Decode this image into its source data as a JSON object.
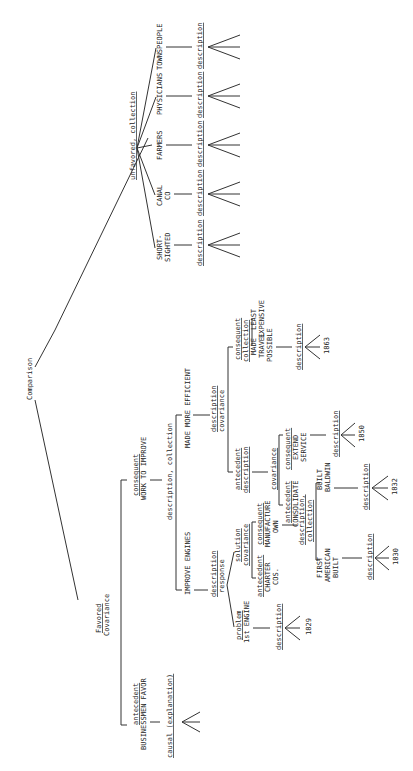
{
  "diagram": {
    "orientation": "rotated-90-ccw",
    "root": "Comparison",
    "favored": {
      "top": "Favored",
      "bottom": "Covariance"
    },
    "unfavored": "unfavored, collection",
    "unfavored_items": [
      {
        "label": "SHORT-\nSIGHTED",
        "lines": [
          "SHORT-",
          "SIGHTED"
        ],
        "desc": "description"
      },
      {
        "label": "CANAL CO",
        "lines": [
          "CANAL",
          "CO"
        ],
        "desc": "description"
      },
      {
        "label": "FARMERS",
        "lines": [
          "FARMERS"
        ],
        "desc": "description"
      },
      {
        "label": "PHYSICIANS",
        "lines": [
          "PHYSICIANS"
        ],
        "desc": "description"
      },
      {
        "label": "TOWNSPEOPLE",
        "lines": [
          "TOWNSPEOPLE"
        ],
        "desc": "description"
      }
    ],
    "antecedent": {
      "role": "antecedent",
      "text": "BUSINESSMEN FAVOR",
      "desc": "causal (explanation)"
    },
    "consequent": {
      "role": "consequent",
      "text": "WORK TO IMPROVE",
      "desc": "description, collection"
    },
    "improve_engines": {
      "label": "IMPROVE ENGINES",
      "relation": {
        "top": "description",
        "bottom": "response"
      },
      "problem": {
        "role": "problem",
        "text": "1st ENGINE",
        "desc": "description",
        "year": "1829"
      },
      "solution": {
        "relation": {
          "top": "solution",
          "bottom": "covariance"
        },
        "antecedent": {
          "role": "antecedent",
          "lines": [
            "CHARTER",
            "COS."
          ]
        },
        "consequent": {
          "role": "consequent",
          "lines": [
            "MANUFACTURE",
            "OWN"
          ]
        },
        "collection": {
          "top": "description,",
          "bottom": "collection"
        },
        "items": [
          {
            "lines": [
              "FIRST",
              "AMERICAN",
              "BUILT"
            ],
            "desc": "description",
            "year": "1830"
          },
          {
            "lines": [
              "BUILT",
              "BALDWIN"
            ],
            "desc": "description",
            "year": "1832"
          }
        ]
      }
    },
    "made_more_efficient": {
      "label": "MADE MORE EFFICIENT",
      "relation": {
        "top": "description",
        "bottom": "covariance"
      },
      "antecedent": {
        "relation": {
          "top": "antecedent",
          "bottom": "description"
        },
        "covariance": "covariance",
        "a": {
          "role": "antecedent",
          "text": "CONSOLIDATE"
        },
        "c": {
          "role": "consequent",
          "lines": [
            "EXTEND",
            "SERVICE"
          ]
        },
        "desc": "description",
        "year": "1850"
      },
      "consequent": {
        "relation": {
          "top": "consequent",
          "bottom": "collection"
        },
        "items": [
          {
            "lines": [
              "MADE",
              "TRAVEL",
              "POSSIBLE"
            ]
          },
          {
            "lines": [
              "LEAST",
              "EXPENSIVE"
            ]
          }
        ],
        "desc": "description",
        "year": "1863"
      }
    }
  }
}
